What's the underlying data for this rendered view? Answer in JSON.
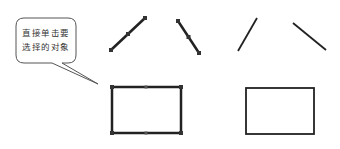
{
  "callout": {
    "line1": "直接单击要",
    "line2": "选择的对象"
  },
  "colors": {
    "stroke": "#222222",
    "callout_border": "#555555",
    "grip": "#333333",
    "background": "#ffffff"
  },
  "objects": {
    "selected": [
      {
        "type": "line",
        "x1": 111,
        "y1": 50,
        "x2": 145,
        "y2": 18,
        "grips": 3
      },
      {
        "type": "line",
        "x1": 178,
        "y1": 21,
        "x2": 199,
        "y2": 53,
        "grips": 3
      },
      {
        "type": "rectangle",
        "x": 112,
        "y": 87,
        "width": 69,
        "height": 46,
        "grips": 6
      }
    ],
    "unselected": [
      {
        "type": "line",
        "x1": 238,
        "y1": 51,
        "x2": 257,
        "y2": 18
      },
      {
        "type": "line",
        "x1": 293,
        "y1": 23,
        "x2": 326,
        "y2": 50
      },
      {
        "type": "rectangle",
        "x": 246,
        "y": 88,
        "width": 68,
        "height": 46
      }
    ]
  }
}
